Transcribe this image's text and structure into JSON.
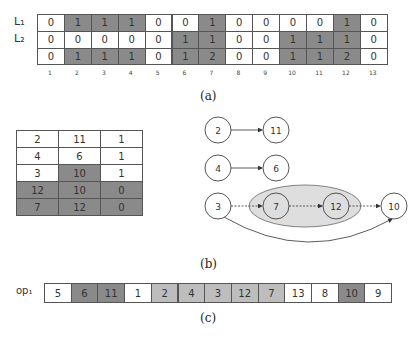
{
  "panel_a": {
    "row_labels": [
      "L₁",
      "L₂",
      ""
    ],
    "rows": [
      [
        "0",
        "1",
        "1",
        "1",
        "0",
        "0",
        "1",
        "0",
        "0",
        "0",
        "0",
        "1",
        "0"
      ],
      [
        "0",
        "0",
        "0",
        "0",
        "0",
        "1",
        "1",
        "0",
        "0",
        "1",
        "1",
        "1",
        "0"
      ],
      [
        "0",
        "1",
        "1",
        "1",
        "0",
        "1",
        "2",
        "0",
        "0",
        "1",
        "1",
        "2",
        "0"
      ]
    ],
    "shaded": [
      [
        false,
        true,
        true,
        true,
        false,
        false,
        true,
        false,
        false,
        false,
        false,
        true,
        false
      ],
      [
        false,
        false,
        false,
        false,
        false,
        true,
        true,
        false,
        false,
        true,
        true,
        true,
        false
      ],
      [
        false,
        true,
        true,
        true,
        false,
        true,
        true,
        false,
        false,
        true,
        true,
        true,
        false
      ]
    ],
    "column_numbers": [
      "1",
      "2",
      "3",
      "4",
      "5",
      "6",
      "7",
      "8",
      "9",
      "10",
      "11",
      "12",
      "13"
    ],
    "caption": "(a)"
  },
  "panel_b": {
    "table": {
      "rows": [
        [
          "2",
          "11",
          "1"
        ],
        [
          "4",
          "6",
          "1"
        ],
        [
          "3",
          "10",
          "1"
        ],
        [
          "12",
          "10",
          "0"
        ],
        [
          "7",
          "12",
          "0"
        ]
      ],
      "shaded": [
        [
          false,
          false,
          false
        ],
        [
          false,
          false,
          false
        ],
        [
          false,
          true,
          false
        ],
        [
          true,
          true,
          true
        ],
        [
          true,
          true,
          true
        ]
      ]
    },
    "graph": {
      "nodes": [
        {
          "id": "n2",
          "label": "2",
          "x": 218,
          "y": 130
        },
        {
          "id": "n11",
          "label": "11",
          "x": 276,
          "y": 130
        },
        {
          "id": "n4",
          "label": "4",
          "x": 218,
          "y": 168
        },
        {
          "id": "n6",
          "label": "6",
          "x": 276,
          "y": 168
        },
        {
          "id": "n3",
          "label": "3",
          "x": 218,
          "y": 206
        },
        {
          "id": "n7",
          "label": "7",
          "x": 276,
          "y": 206
        },
        {
          "id": "n12",
          "label": "12",
          "x": 336,
          "y": 206
        },
        {
          "id": "n10",
          "label": "10",
          "x": 394,
          "y": 206
        }
      ],
      "edges": [
        {
          "from": "2",
          "to": "11",
          "style": "solid"
        },
        {
          "from": "4",
          "to": "6",
          "style": "solid"
        },
        {
          "from": "3",
          "to": "7",
          "style": "dashed"
        },
        {
          "from": "7",
          "to": "12",
          "style": "dashed"
        },
        {
          "from": "12",
          "to": "10",
          "style": "dashed"
        },
        {
          "from": "3",
          "to": "10",
          "style": "curved-solid"
        }
      ],
      "group": {
        "members": [
          "7",
          "12"
        ],
        "fill": "#dedede"
      }
    },
    "caption": "(b)"
  },
  "panel_c": {
    "row_label": "op₁",
    "cells": [
      "5",
      "6",
      "11",
      "1",
      "2",
      "4",
      "3",
      "12",
      "7",
      "13",
      "8",
      "10",
      "9"
    ],
    "shades": [
      "white",
      "dark",
      "dark",
      "white",
      "light",
      "light",
      "light",
      "light",
      "light",
      "white",
      "white",
      "dark",
      "white"
    ],
    "caption": "(c)"
  },
  "colors": {
    "dark": "#8a8a8a",
    "light": "#bdbdbd",
    "white": "#ffffff",
    "group_fill": "#dedede",
    "border": "#555555"
  }
}
